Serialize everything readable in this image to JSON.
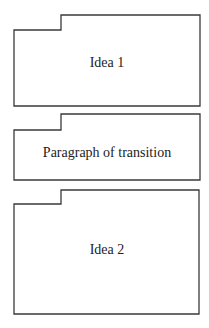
{
  "diagram": {
    "type": "stacked-tabbed-blocks",
    "stroke_color": "#3a3a3a",
    "background_color": "#ffffff",
    "text_color": "#222222",
    "blocks": [
      {
        "id": "idea-1",
        "label": "Idea 1",
        "shape": "folder-tab-left-notch",
        "x_left": 14,
        "x_notch": 61,
        "x_right": 200,
        "y_top": 15,
        "y_step": 30,
        "y_bottom": 106,
        "label_y": 55
      },
      {
        "id": "transition",
        "label": "Paragraph of transition",
        "shape": "folder-tab-left-notch",
        "x_left": 14,
        "x_notch": 61,
        "x_right": 200,
        "y_top": 114,
        "y_step": 130,
        "y_bottom": 180,
        "label_y": 145
      },
      {
        "id": "idea-2",
        "label": "Idea 2",
        "shape": "folder-tab-left-notch",
        "x_left": 14,
        "x_notch": 61,
        "x_right": 199,
        "y_top": 190,
        "y_step": 204,
        "y_bottom": 314,
        "label_y": 242
      }
    ]
  }
}
